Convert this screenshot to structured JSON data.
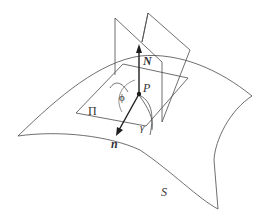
{
  "diagram": {
    "type": "surface-normal-section",
    "labels": {
      "normal_vector": "N",
      "point": "P",
      "angle": "ϕ",
      "tangent_plane": "Π",
      "curve": "γ",
      "direction_vector": "n",
      "surface": "S"
    },
    "colors": {
      "stroke": "#4a4a4a",
      "vector": "#1e1e1e",
      "background": "#ffffff"
    }
  }
}
